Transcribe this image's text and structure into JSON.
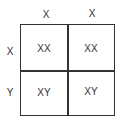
{
  "punnett": {
    "columns": [
      "X",
      "X"
    ],
    "rows": [
      "X",
      "Y"
    ],
    "cells": [
      [
        "XX",
        "XX"
      ],
      [
        "XY",
        "XY"
      ]
    ]
  }
}
